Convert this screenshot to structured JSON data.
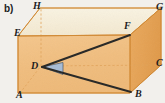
{
  "figure": {
    "part_label": "b)",
    "shape_name": "rectangular-cuboid",
    "background_color": "#f2f0ec",
    "colors": {
      "top_face": "#f7efdc",
      "front_face": "#f2c184",
      "right_face": "#e7a253",
      "edge_stroke": "#d9913f",
      "hidden_edge": "#e2a85f",
      "diagonal_stroke": "#2a2a28",
      "angle_fill": "#a8bcd4",
      "angle_stroke": "#3c4a5c",
      "label_color": "#20201e"
    },
    "vertices": [
      {
        "id": "A",
        "label": "A",
        "x": 20,
        "y": 94,
        "kind": "front-bottom-left"
      },
      {
        "id": "B",
        "label": "B",
        "x": 139,
        "y": 93,
        "kind": "front-bottom-right"
      },
      {
        "id": "C",
        "label": "C",
        "x": 160,
        "y": 63,
        "kind": "back-bottom-right"
      },
      {
        "id": "D",
        "label": "D",
        "x": 41,
        "y": 66,
        "kind": "front-mid-left"
      },
      {
        "id": "E",
        "label": "E",
        "x": 18,
        "y": 33,
        "kind": "front-top-left"
      },
      {
        "id": "F",
        "label": "F",
        "x": 128,
        "y": 26,
        "kind": "front-top-right"
      },
      {
        "id": "G",
        "label": "G",
        "x": 160,
        "y": 7,
        "kind": "back-top-right"
      },
      {
        "id": "H",
        "label": "H",
        "x": 38,
        "y": 5,
        "kind": "back-top-left"
      }
    ],
    "segments": [
      {
        "id": "DF",
        "from": "D",
        "to": "F",
        "style": "solid-dark"
      },
      {
        "id": "DB",
        "from": "D",
        "to": "B",
        "style": "solid-dark"
      }
    ],
    "angle_marker": {
      "at": "D",
      "between": [
        "DF",
        "DB"
      ],
      "shaded": true
    }
  }
}
